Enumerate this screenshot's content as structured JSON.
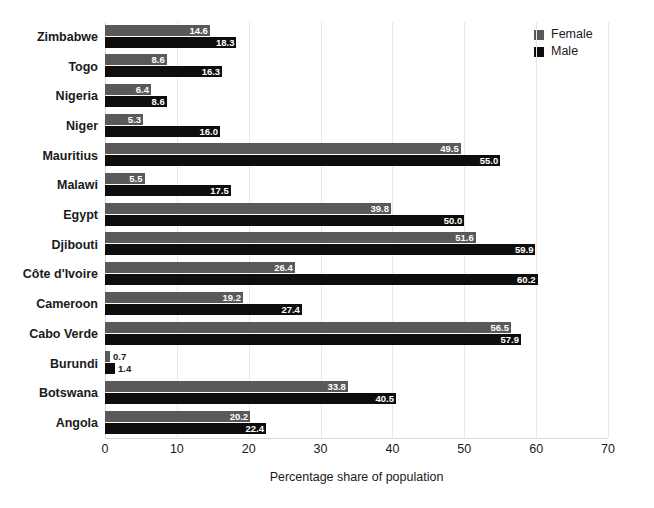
{
  "chart_data": {
    "type": "bar",
    "orientation": "horizontal",
    "title": "",
    "xlabel": "Percentage share of population",
    "ylabel": "",
    "xlim": [
      0,
      70
    ],
    "xticks": [
      0,
      10,
      20,
      30,
      40,
      50,
      60,
      70
    ],
    "grid": true,
    "legend_position": "top-right",
    "categories": [
      "Zimbabwe",
      "Togo",
      "Nigeria",
      "Niger",
      "Mauritius",
      "Malawi",
      "Egypt",
      "Djibouti",
      "Côte d'Ivoire",
      "Cameroon",
      "Cabo Verde",
      "Burundi",
      "Botswana",
      "Angola"
    ],
    "series": [
      {
        "name": "Female",
        "color": "#595959",
        "values": [
          14.6,
          8.6,
          6.4,
          5.3,
          49.5,
          5.5,
          39.8,
          51.6,
          26.4,
          19.2,
          56.5,
          0.7,
          33.8,
          20.2
        ],
        "labels": [
          "14.6",
          "8.6",
          "6.4",
          "5.3",
          "49.5",
          "5.5",
          "39.8",
          "51.6",
          "26.4",
          "19.2",
          "56.5",
          "0.7",
          "33.8",
          "20.2"
        ]
      },
      {
        "name": "Male",
        "color": "#0d0d0d",
        "values": [
          18.3,
          16.3,
          8.6,
          16.0,
          55.0,
          17.5,
          50.0,
          59.9,
          60.2,
          27.4,
          57.9,
          1.4,
          40.5,
          22.4
        ],
        "labels": [
          "18.3",
          "16.3",
          "8.6",
          "16.0",
          "55.0",
          "59.9",
          "50.0",
          "59.9",
          "60.2",
          "27.4",
          "57.9",
          "1.4",
          "40.5",
          "22.4"
        ]
      }
    ]
  },
  "legend": {
    "items": [
      {
        "label": "Female",
        "color": "#595959"
      },
      {
        "label": "Male",
        "color": "#0d0d0d"
      }
    ]
  },
  "axis": {
    "x_title": "Percentage share of population",
    "tick_labels": [
      "0",
      "10",
      "20",
      "30",
      "40",
      "50",
      "60",
      "70"
    ]
  },
  "rows": [
    {
      "country": "Zimbabwe",
      "female": "14.6",
      "male": "18.3"
    },
    {
      "country": "Togo",
      "female": "8.6",
      "male": "16.3"
    },
    {
      "country": "Nigeria",
      "female": "6.4",
      "male": "8.6"
    },
    {
      "country": "Niger",
      "female": "5.3",
      "male": "16.0"
    },
    {
      "country": "Mauritius",
      "female": "49.5",
      "male": "55.0"
    },
    {
      "country": "Malawi",
      "female": "5.5",
      "male": "17.5"
    },
    {
      "country": "Egypt",
      "female": "39.8",
      "male": "50.0"
    },
    {
      "country": "Djibouti",
      "female": "51.6",
      "male": "59.9"
    },
    {
      "country": "Côte d'Ivoire",
      "female": "26.4",
      "male": "60.2"
    },
    {
      "country": "Cameroon",
      "female": "19.2",
      "male": "27.4"
    },
    {
      "country": "Cabo Verde",
      "female": "56.5",
      "male": "57.9"
    },
    {
      "country": "Burundi",
      "female": "0.7",
      "male": "1.4"
    },
    {
      "country": "Botswana",
      "female": "33.8",
      "male": "40.5"
    },
    {
      "country": "Angola",
      "female": "20.2",
      "male": "22.4"
    }
  ]
}
